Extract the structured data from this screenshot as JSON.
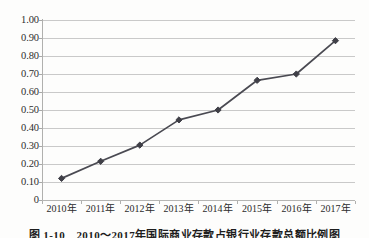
{
  "chart_data": {
    "type": "line",
    "title": "",
    "xlabel": "",
    "ylabel": "",
    "categories": [
      "2010年",
      "2011年",
      "2012年",
      "2013年",
      "2014年",
      "2015年",
      "2016年",
      "2017年"
    ],
    "values": [
      0.12,
      0.215,
      0.305,
      0.445,
      0.5,
      0.665,
      0.7,
      0.885
    ],
    "series": [
      {
        "name": "",
        "values": [
          0.12,
          0.215,
          0.305,
          0.445,
          0.5,
          0.665,
          0.7,
          0.885
        ]
      }
    ],
    "ylim": [
      0,
      1.0
    ],
    "ytick_values": [
      1.0,
      0.9,
      0.8,
      0.7,
      0.6,
      0.5,
      0.4,
      0.3,
      0.2,
      0.1,
      0
    ],
    "ytick_labels": [
      "1.00",
      "0.90",
      "0.80",
      "0.70",
      "0.60",
      "0.50",
      "0.40",
      "0.30",
      "0.20",
      "0.10",
      "0"
    ],
    "grid": true,
    "grid_axis": "y",
    "legend": false,
    "legend_position": "none",
    "marker": "diamond",
    "line_color": "#4a4a52",
    "marker_color": "#3f3f47",
    "grid_color": "#c9c9c9",
    "axis_color": "#b0b0ae",
    "background": "#fdfdfc"
  },
  "caption": {
    "text": "图 1-10　2010～2017年国际商业存款占银行业存款总额比例图"
  }
}
